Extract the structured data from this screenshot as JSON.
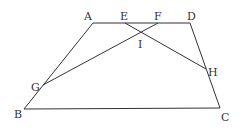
{
  "diagram": {
    "type": "trapezoid",
    "colors": {
      "line": "#333333",
      "label": "#333333",
      "background": "#ffffff"
    },
    "points": {
      "A": {
        "label": "A",
        "x": 93,
        "y": 23
      },
      "D": {
        "label": "D",
        "x": 190,
        "y": 23
      },
      "B": {
        "label": "B",
        "x": 24,
        "y": 109
      },
      "C": {
        "label": "C",
        "x": 220,
        "y": 108
      },
      "E": {
        "label": "E",
        "x": 125,
        "y": 23
      },
      "F": {
        "label": "F",
        "x": 158,
        "y": 23
      },
      "G": {
        "label": "G",
        "x": 43,
        "y": 85
      },
      "H": {
        "label": "H",
        "x": 206,
        "y": 69
      },
      "I": {
        "label": "I",
        "x": 142,
        "y": 32
      }
    },
    "segments": [
      {
        "from": "A",
        "to": "D"
      },
      {
        "from": "A",
        "to": "B"
      },
      {
        "from": "B",
        "to": "C"
      },
      {
        "from": "D",
        "to": "C"
      },
      {
        "from": "G",
        "to": "F"
      },
      {
        "from": "E",
        "to": "H"
      }
    ],
    "label_positions": {
      "A": {
        "x": 84,
        "y": 20
      },
      "E": {
        "x": 120,
        "y": 20
      },
      "F": {
        "x": 154,
        "y": 20
      },
      "D": {
        "x": 187,
        "y": 20
      },
      "I": {
        "x": 138,
        "y": 48
      },
      "G": {
        "x": 31,
        "y": 91
      },
      "H": {
        "x": 208,
        "y": 76
      },
      "B": {
        "x": 14,
        "y": 118
      },
      "C": {
        "x": 221,
        "y": 121
      }
    }
  }
}
